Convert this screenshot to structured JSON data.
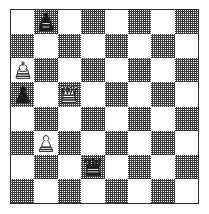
{
  "diagram": {
    "kind": "chess-board-diagram",
    "orientation": "white-bottom",
    "files": [
      "a",
      "b",
      "c",
      "d",
      "e",
      "f",
      "g",
      "h"
    ],
    "ranks": [
      "8",
      "7",
      "6",
      "5",
      "4",
      "3",
      "2",
      "1"
    ],
    "colors": {
      "light_square": "#ffffff",
      "dark_square": "#808080",
      "border": "#2b2b2b",
      "white_piece": "#ffffff",
      "black_piece": "#1a1a1a",
      "page_background": "#ffffff"
    },
    "position_fen": "1k6/8/K7/p1Q5/8/1P6/3q4/8",
    "pieces": [
      {
        "square": "b8",
        "color": "black",
        "type": "king",
        "glyph": "black-king-icon",
        "row": 0,
        "col": 1
      },
      {
        "square": "a6",
        "color": "white",
        "type": "king",
        "glyph": "white-king-icon",
        "row": 2,
        "col": 0
      },
      {
        "square": "a5",
        "color": "black",
        "type": "pawn",
        "glyph": "black-pawn-icon",
        "row": 3,
        "col": 0
      },
      {
        "square": "c5",
        "color": "white",
        "type": "queen",
        "glyph": "white-queen-icon",
        "row": 3,
        "col": 2
      },
      {
        "square": "b3",
        "color": "white",
        "type": "pawn",
        "glyph": "white-pawn-icon",
        "row": 5,
        "col": 1
      },
      {
        "square": "d2",
        "color": "black",
        "type": "queen",
        "glyph": "black-queen-icon",
        "row": 6,
        "col": 3
      }
    ],
    "squares": [
      [
        "light",
        "dark",
        "light",
        "dark",
        "light",
        "dark",
        "light",
        "dark"
      ],
      [
        "dark",
        "light",
        "dark",
        "light",
        "dark",
        "light",
        "dark",
        "light"
      ],
      [
        "light",
        "dark",
        "light",
        "dark",
        "light",
        "dark",
        "light",
        "dark"
      ],
      [
        "dark",
        "light",
        "dark",
        "light",
        "dark",
        "light",
        "dark",
        "light"
      ],
      [
        "light",
        "dark",
        "light",
        "dark",
        "light",
        "dark",
        "light",
        "dark"
      ],
      [
        "dark",
        "light",
        "dark",
        "light",
        "dark",
        "light",
        "dark",
        "light"
      ],
      [
        "light",
        "dark",
        "light",
        "dark",
        "light",
        "dark",
        "light",
        "dark"
      ],
      [
        "dark",
        "light",
        "dark",
        "light",
        "dark",
        "light",
        "dark",
        "light"
      ]
    ]
  }
}
